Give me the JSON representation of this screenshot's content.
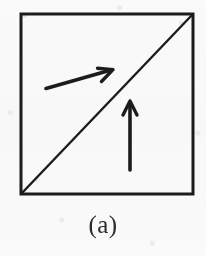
{
  "figure": {
    "caption": "(a)",
    "type": "line-diagram",
    "colors": {
      "background": "#fcfcfc",
      "ink": "#1c1c1c",
      "caption": "#2b2b2b"
    },
    "canvas": {
      "width": 206,
      "height": 256
    },
    "shapes": {
      "square": {
        "name": "square-outline",
        "x": 21,
        "y": 14,
        "width": 172,
        "height": 180,
        "stroke_width": 3
      },
      "diagonal": {
        "name": "diagonal-line",
        "x1": 22,
        "y1": 193,
        "x2": 192,
        "y2": 15,
        "stroke_width": 2.4
      }
    },
    "arrows": [
      {
        "name": "upper-left-arrow",
        "label": "horizontal vector",
        "x1": 46,
        "y1": 88,
        "x2": 113,
        "y2": 70,
        "stroke_width": 3.6,
        "head_length": 17,
        "head_angle_deg": 21
      },
      {
        "name": "lower-right-arrow",
        "label": "vertical vector",
        "x1": 130,
        "y1": 170,
        "x2": 130,
        "y2": 101,
        "stroke_width": 3.6,
        "head_length": 16,
        "head_angle_deg": 22
      }
    ]
  }
}
